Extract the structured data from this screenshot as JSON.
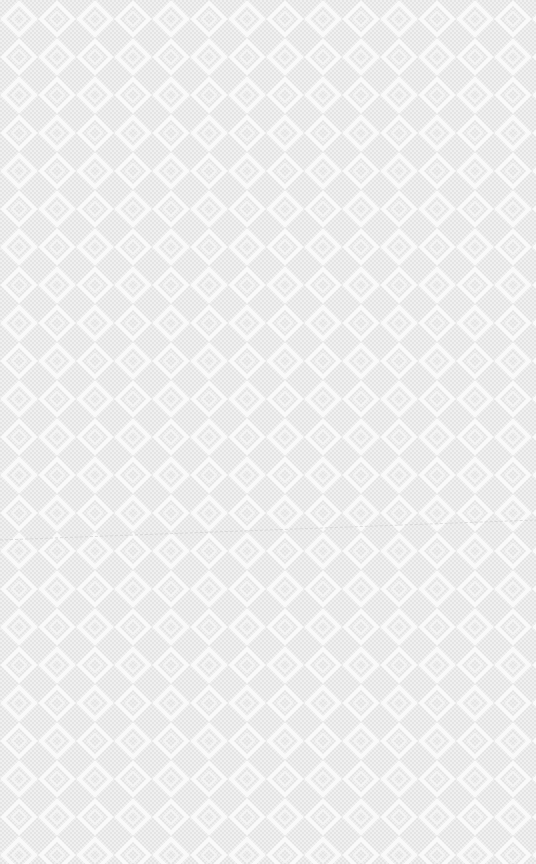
{
  "background": {
    "pattern": "diamond-zigzag-lattice",
    "base_color": "#e9e9e9",
    "line_color": "#fafafa"
  },
  "faint_text": "",
  "crease": {
    "from": [
      0,
      540
    ],
    "to": [
      536,
      520
    ],
    "color": "#cfcfcf"
  }
}
